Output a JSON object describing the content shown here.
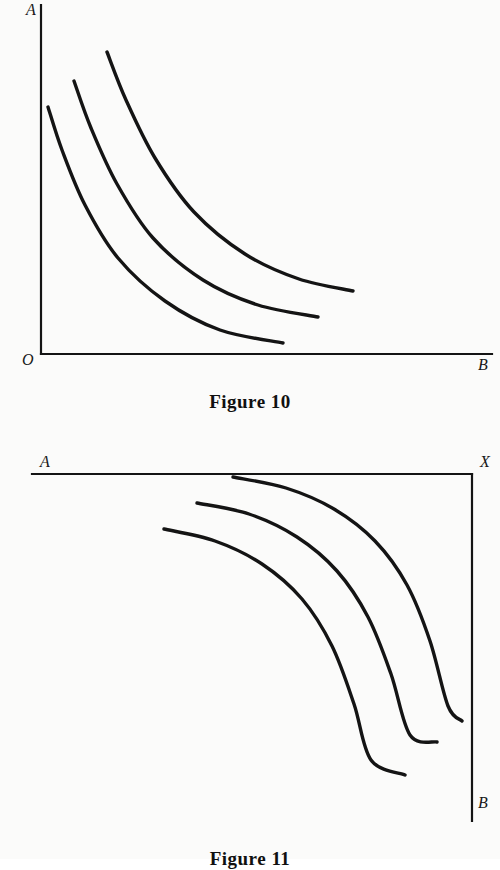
{
  "page": {
    "background_color": "#fbfbfa",
    "ink_color": "#141414",
    "width": 500,
    "height": 859
  },
  "figures": [
    {
      "id": "figure-10",
      "caption": "Figure 10",
      "axes": {
        "vertical_label": "A",
        "horizontal_label": "B",
        "origin_label": "O",
        "origin_corner": "bottom-left",
        "vertical_axis": {
          "x": 41,
          "y_top": 5,
          "y_bottom": 354
        },
        "horizontal_axis": {
          "y": 354,
          "x_left": 41,
          "x_right": 492
        }
      },
      "chart_data": {
        "type": "line",
        "title": "Figure 10",
        "xlabel": "B",
        "ylabel": "A",
        "grid": false,
        "legend": "none",
        "description": "Three convex-to-origin indifference curves in the positive quadrant, origin O at bottom-left; higher curves lie farther from the origin.",
        "series": [
          {
            "name": "indifference-curve-1",
            "points": [
              [
                48,
                107
              ],
              [
                62,
                150
              ],
              [
                85,
                205
              ],
              [
                118,
                258
              ],
              [
                165,
                301
              ],
              [
                220,
                330
              ],
              [
                283,
                343
              ]
            ]
          },
          {
            "name": "indifference-curve-2",
            "points": [
              [
                74,
                81
              ],
              [
                91,
                128
              ],
              [
                117,
                184
              ],
              [
                153,
                238
              ],
              [
                203,
                280
              ],
              [
                258,
                305
              ],
              [
                318,
                317
              ]
            ]
          },
          {
            "name": "indifference-curve-3",
            "points": [
              [
                107,
                52
              ],
              [
                126,
                100
              ],
              [
                155,
                158
              ],
              [
                194,
                212
              ],
              [
                245,
                254
              ],
              [
                299,
                279
              ],
              [
                353,
                291
              ]
            ]
          }
        ]
      }
    },
    {
      "id": "figure-11",
      "caption": "Figure 11",
      "axes": {
        "horizontal_label_left": "A",
        "corner_label": "X",
        "vertical_label": "B",
        "origin_corner": "top-right",
        "horizontal_axis": {
          "y": 44,
          "x_left": 32,
          "x_right": 472
        },
        "vertical_axis": {
          "x": 472,
          "y_top": 44,
          "y_bottom": 391
        }
      },
      "chart_data": {
        "type": "line",
        "title": "Figure 11",
        "xlabel": "A",
        "ylabel": "B",
        "grid": false,
        "legend": "none",
        "description": "Three curves convex toward the top-right corner X, between a horizontal axis A along the top and a vertical axis B down the right side.",
        "series": [
          {
            "name": "curve-1-outer",
            "points": [
              [
                233,
                47
              ],
              [
                286,
                58
              ],
              [
                334,
                79
              ],
              [
                375,
                111
              ],
              [
                407,
                155
              ],
              [
                430,
                211
              ],
              [
                448,
                276
              ],
              [
                462,
                291
              ]
            ]
          },
          {
            "name": "curve-2-middle",
            "points": [
              [
                197,
                73
              ],
              [
                249,
                84
              ],
              [
                297,
                107
              ],
              [
                337,
                141
              ],
              [
                368,
                187
              ],
              [
                391,
                244
              ],
              [
                410,
                305
              ],
              [
                437,
                312
              ]
            ]
          },
          {
            "name": "curve-3-inner",
            "points": [
              [
                164,
                99
              ],
              [
                215,
                111
              ],
              [
                262,
                134
              ],
              [
                302,
                169
              ],
              [
                332,
                216
              ],
              [
                354,
                274
              ],
              [
                371,
                330
              ],
              [
                405,
                345
              ]
            ]
          }
        ]
      }
    }
  ]
}
